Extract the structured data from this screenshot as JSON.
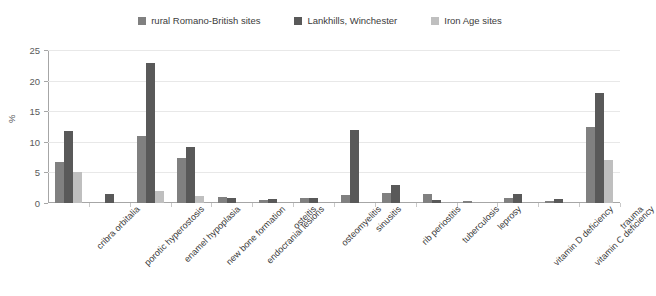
{
  "chart_data": {
    "type": "bar",
    "title": "",
    "xlabel": "",
    "ylabel": "%",
    "ylim": [
      0,
      25
    ],
    "yticks": [
      0,
      5,
      10,
      15,
      20,
      25
    ],
    "grid": true,
    "legend_position": "top-center",
    "categories": [
      "cribra orbitalia",
      "porotic hyperostosis",
      "enamel hypoplasia",
      "new bone formation",
      "endocranial lesions",
      "osteitis",
      "osteomyelitis",
      "sinusitis",
      "rib periostitis",
      "tuberculosis",
      "leprosy",
      "vitamin D deficiency",
      "vitamin C deficiency",
      "trauma"
    ],
    "series": [
      {
        "name": "rural Romano-British sites",
        "color": "#808080",
        "values": [
          6.7,
          0,
          11.0,
          7.3,
          1.0,
          0.5,
          0.8,
          1.3,
          1.6,
          1.5,
          0.4,
          0.8,
          0.4,
          12.5
        ]
      },
      {
        "name": "Lankhills, Winchester",
        "color": "#595959",
        "values": [
          11.8,
          1.5,
          22.8,
          9.2,
          0.9,
          0.6,
          0.9,
          12.0,
          3.0,
          0.5,
          0,
          1.5,
          0.6,
          18.0
        ]
      },
      {
        "name": "Iron Age sites",
        "color": "#bfbfbf",
        "values": [
          5.0,
          0,
          2.0,
          1.2,
          0,
          0,
          0,
          0,
          0,
          0,
          0,
          0,
          0,
          7.1
        ]
      }
    ]
  },
  "legend": {
    "items": [
      {
        "label": "rural Romano-British sites",
        "color": "#808080"
      },
      {
        "label": "Lankhills, Winchester",
        "color": "#595959"
      },
      {
        "label": "Iron Age sites",
        "color": "#bfbfbf"
      }
    ]
  },
  "axes": {
    "y_title": "%",
    "y_tick_labels": [
      "0",
      "5",
      "10",
      "15",
      "20",
      "25"
    ]
  }
}
